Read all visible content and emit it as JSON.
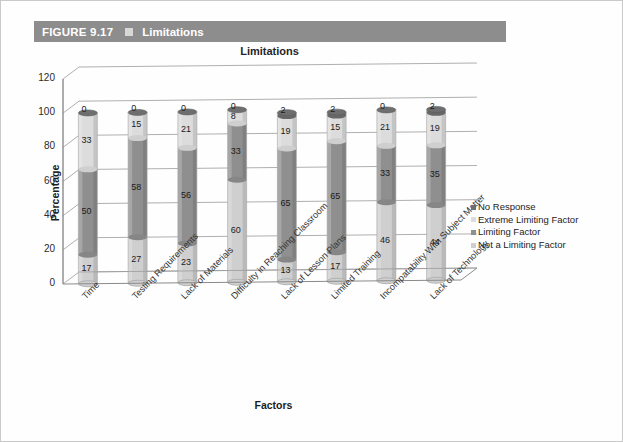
{
  "figure": {
    "number": "FIGURE 9.17",
    "marker_icon": "square-icon",
    "title": "Limitations",
    "bar_color": "#8d8d8d"
  },
  "chart_data": {
    "type": "bar",
    "subtype": "stacked-100-3d-cylinder",
    "title": "Limitations",
    "xlabel": "Factors",
    "ylabel": "Percentage",
    "ylim": [
      0,
      120
    ],
    "yticks": [
      0,
      20,
      40,
      60,
      80,
      100,
      120
    ],
    "grid": true,
    "legend_position": "right",
    "categories": [
      "Time",
      "Testing Requirements",
      "Lack of Materials",
      "Difficulty in Reaching Classroom",
      "Lack of Lesson Plans",
      "Limited Training",
      "Incompatability With Subject Matter",
      "Lack of Technology"
    ],
    "series": [
      {
        "name": "Not a Limiting Factor",
        "color": "#cfcfcf",
        "values": [
          17,
          27,
          23,
          60,
          13,
          17,
          46,
          44
        ]
      },
      {
        "name": "Limiting Factor",
        "color": "#8f8f8f",
        "values": [
          50,
          58,
          56,
          33,
          65,
          65,
          33,
          35
        ]
      },
      {
        "name": "Extreme Limiting Factor",
        "color": "#dcdcdc",
        "values": [
          33,
          15,
          21,
          8,
          19,
          15,
          21,
          19
        ]
      },
      {
        "name": "No Response",
        "color": "#6e6e6e",
        "values": [
          0,
          0,
          0,
          0,
          2,
          2,
          0,
          2
        ]
      }
    ]
  },
  "legend": {
    "items": [
      {
        "label": "No Response",
        "color": "#6e6e6e"
      },
      {
        "label": "Extreme Limiting Factor",
        "color": "#dcdcdc"
      },
      {
        "label": "Limiting Factor",
        "color": "#8f8f8f"
      },
      {
        "label": "Not a Limiting Factor",
        "color": "#cfcfcf"
      }
    ]
  }
}
